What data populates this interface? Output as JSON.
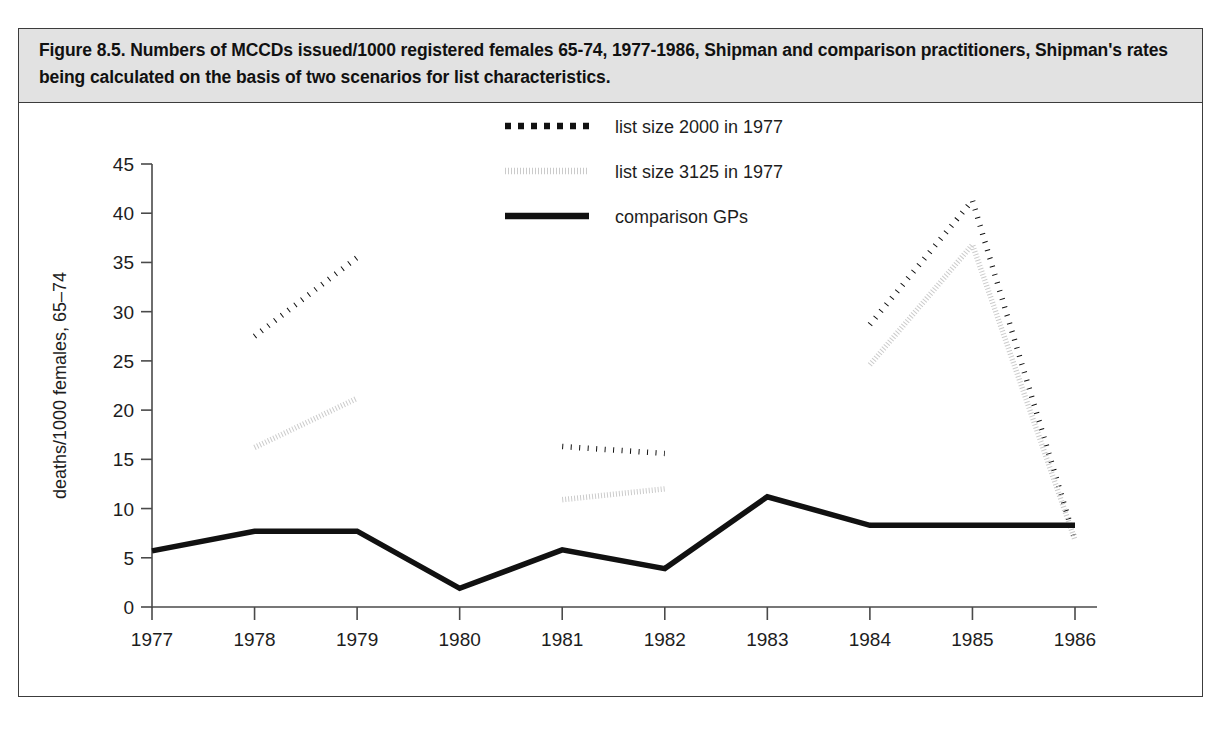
{
  "figure": {
    "caption": "Figure 8.5. Numbers of MCCDs issued/1000 registered females 65-74, 1977-1986, Shipman and comparison practitioners, Shipman's rates being calculated on the basis of two scenarios for list characteristics."
  },
  "chart_data": {
    "type": "line",
    "title": "",
    "xlabel": "year",
    "ylabel": "deaths/1000 females, 65–74",
    "categories": [
      1977,
      1978,
      1979,
      1980,
      1981,
      1982,
      1983,
      1984,
      1985,
      1986
    ],
    "xtick_labels": [
      "1977",
      "1978",
      "1979",
      "1980",
      "1981",
      "1982",
      "1983",
      "1984",
      "1985",
      "1986"
    ],
    "ytick_labels": [
      "0",
      "5",
      "10",
      "15",
      "20",
      "25",
      "30",
      "35",
      "40",
      "45"
    ],
    "xlim": [
      1977,
      1986
    ],
    "ylim": [
      0,
      45
    ],
    "ytick_step": 5,
    "grid": false,
    "legend_position": "top-center",
    "series": [
      {
        "name": "list size 2000 in 1977",
        "style": "dotted",
        "color": "#111111",
        "width": 5.5,
        "dash": "1,7.5",
        "segments": [
          [
            {
              "x": 1978,
              "y": 27.5
            },
            {
              "x": 1979,
              "y": 35.5
            }
          ],
          [
            {
              "x": 1981,
              "y": 16.3
            },
            {
              "x": 1982,
              "y": 15.6
            }
          ],
          [
            {
              "x": 1984,
              "y": 28.7
            },
            {
              "x": 1985,
              "y": 41.3
            },
            {
              "x": 1986,
              "y": 6.8
            }
          ]
        ]
      },
      {
        "name": "list size 3125 in 1977",
        "style": "dotted",
        "color": "#cbcbcb",
        "width": 5.5,
        "dash": "1,2",
        "segments": [
          [
            {
              "x": 1978,
              "y": 16.2
            },
            {
              "x": 1979,
              "y": 21.2
            }
          ],
          [
            {
              "x": 1981,
              "y": 10.9
            },
            {
              "x": 1982,
              "y": 12.0
            }
          ],
          [
            {
              "x": 1984,
              "y": 24.6
            },
            {
              "x": 1985,
              "y": 36.8
            },
            {
              "x": 1986,
              "y": 6.8
            }
          ]
        ]
      },
      {
        "name": "comparison GPs",
        "style": "solid",
        "color": "#111111",
        "width": 5.5,
        "dash": "",
        "values": [
          5.7,
          7.7,
          7.7,
          1.9,
          5.8,
          3.9,
          11.2,
          8.3,
          8.3,
          8.3
        ]
      }
    ],
    "legend": [
      {
        "label": "list size 2000 in 1977",
        "color": "#111111",
        "style": "dotted",
        "dash": "6,7"
      },
      {
        "label": "list size 3125 in 1977",
        "color": "#cbcbcb",
        "style": "dotted",
        "dash": "1,2"
      },
      {
        "label": "comparison GPs",
        "color": "#111111",
        "style": "solid",
        "dash": ""
      }
    ]
  }
}
